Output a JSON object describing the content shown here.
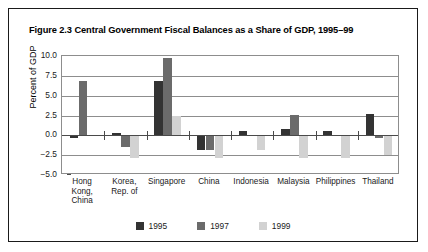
{
  "figure": {
    "title": "Figure 2.3 Central Government Fiscal Balances as a Share of GDP, 1995–99"
  },
  "chart_data": {
    "type": "bar",
    "title": "Figure 2.3 Central Government Fiscal Balances as a Share of GDP, 1995–99",
    "xlabel": "",
    "ylabel": "Percent of GDP",
    "ylim": [
      -5.0,
      10.0
    ],
    "yticks": [
      "10.0",
      "7.5",
      "5.0",
      "2.5",
      "0.0",
      "−2.5",
      "−5.0"
    ],
    "ytick_values": [
      10.0,
      7.5,
      5.0,
      2.5,
      0.0,
      -2.5,
      -5.0
    ],
    "grid": true,
    "legend_position": "bottom",
    "categories": [
      "Hong\nKong,\nChina",
      "Korea,\nRep. of",
      "Singapore",
      "China",
      "Indonesia",
      "Malaysia",
      "Philippines",
      "Thailand"
    ],
    "series": [
      {
        "name": "1995",
        "color": "#333333",
        "values": [
          -0.3,
          0.3,
          6.9,
          -1.9,
          0.5,
          0.8,
          0.5,
          2.7
        ]
      },
      {
        "name": "1997",
        "color": "#6b6b6b",
        "values": [
          6.8,
          -1.5,
          9.7,
          -1.8,
          0.05,
          2.6,
          0.05,
          -0.3
        ]
      },
      {
        "name": "1999",
        "color": "#d2d2d2",
        "values": [
          0.05,
          -2.9,
          2.4,
          -2.9,
          -1.9,
          -2.9,
          -2.9,
          -2.5
        ]
      }
    ]
  }
}
